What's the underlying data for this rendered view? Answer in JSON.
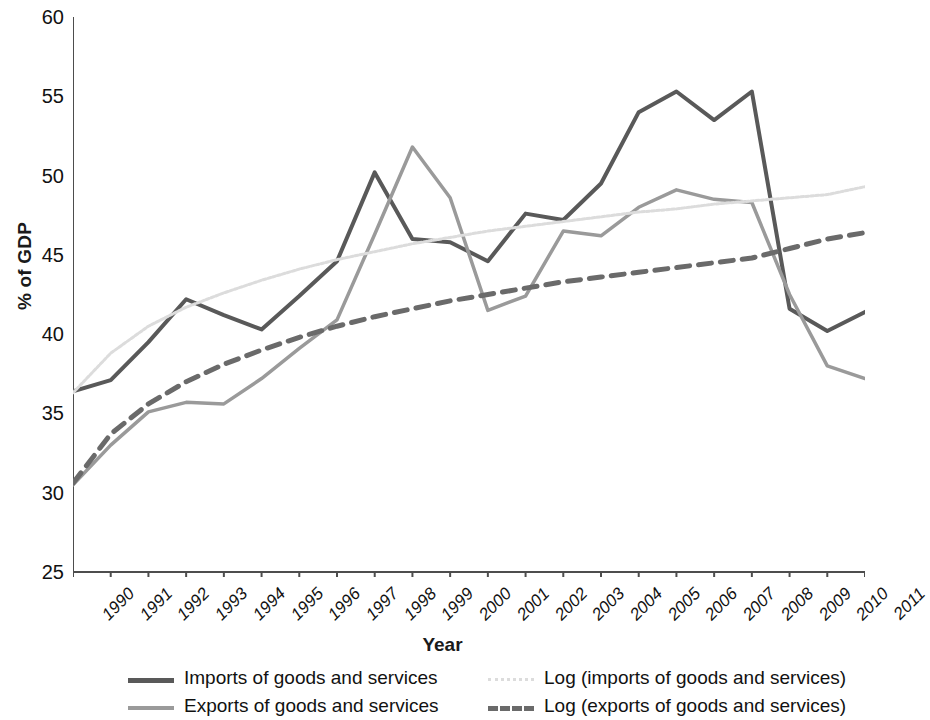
{
  "chart_data": {
    "type": "line",
    "title": "",
    "xlabel": "Year",
    "ylabel": "% of GDP",
    "xlim": [
      1990,
      2011
    ],
    "ylim": [
      25,
      60
    ],
    "yticks": [
      25,
      30,
      35,
      40,
      45,
      50,
      55,
      60
    ],
    "grid": false,
    "legend_position": "bottom",
    "x": [
      1990,
      1991,
      1992,
      1993,
      1994,
      1995,
      1996,
      1997,
      1998,
      1999,
      2000,
      2001,
      2002,
      2003,
      2004,
      2005,
      2006,
      2007,
      2008,
      2009,
      2010,
      2011
    ],
    "categories": [
      "1990",
      "1991",
      "1992",
      "1993",
      "1994",
      "1995",
      "1996",
      "1997",
      "1998",
      "1999",
      "2000",
      "2001",
      "2002",
      "2003",
      "2004",
      "2005",
      "2006",
      "2007",
      "2008",
      "2009",
      "2010",
      "2011"
    ],
    "series": [
      {
        "name": "Imports of goods and services",
        "color": "#595959",
        "style": "solid",
        "width": 4,
        "values": [
          36.4,
          37.1,
          39.5,
          42.2,
          41.2,
          40.3,
          42.4,
          44.6,
          50.2,
          46.0,
          45.8,
          44.6,
          47.6,
          47.2,
          49.5,
          54.0,
          55.3,
          53.5,
          55.3,
          41.6,
          40.2,
          41.4
        ]
      },
      {
        "name": "Exports of goods and services",
        "color": "#9a9a9a",
        "style": "solid",
        "width": 3.5,
        "values": [
          30.5,
          33.0,
          35.1,
          35.7,
          35.6,
          37.2,
          39.1,
          40.9,
          46.3,
          51.8,
          48.6,
          41.5,
          42.4,
          46.5,
          46.2,
          48.0,
          49.1,
          48.5,
          48.3,
          42.5,
          38.0,
          37.2
        ]
      },
      {
        "name": "Log (imports of goods and services)",
        "color": "#dcdcdc",
        "style": "dotted",
        "width": 3,
        "values": [
          36.3,
          38.8,
          40.5,
          41.7,
          42.6,
          43.4,
          44.1,
          44.7,
          45.2,
          45.7,
          46.1,
          46.5,
          46.8,
          47.1,
          47.4,
          47.7,
          47.9,
          48.2,
          48.4,
          48.6,
          48.8,
          49.3
        ]
      },
      {
        "name": "Log (exports of goods and services)",
        "color": "#6a6a6a",
        "style": "dashed",
        "width": 5,
        "values": [
          30.6,
          33.7,
          35.6,
          37.0,
          38.1,
          39.0,
          39.8,
          40.5,
          41.1,
          41.6,
          42.1,
          42.5,
          42.9,
          43.3,
          43.6,
          43.9,
          44.2,
          44.5,
          44.8,
          45.4,
          46.0,
          46.4
        ]
      }
    ]
  },
  "axes": {
    "y_title": "% of GDP",
    "x_title": "Year",
    "y_tick_labels": [
      "60",
      "55",
      "50",
      "45",
      "40",
      "35",
      "30",
      "25"
    ]
  },
  "legend": {
    "entries": [
      {
        "label": "Imports of goods and services",
        "swatch": "imports"
      },
      {
        "label": "Log (imports of goods and services)",
        "swatch": "logimports"
      },
      {
        "label": "Exports of goods and services",
        "swatch": "exports"
      },
      {
        "label": "Log (exports of goods and services)",
        "swatch": "logexports"
      }
    ]
  }
}
